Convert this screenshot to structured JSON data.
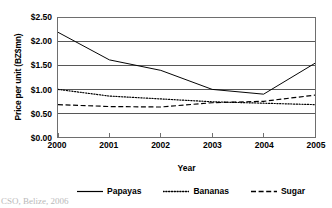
{
  "chart_data": {
    "type": "line",
    "title": "",
    "xlabel": "Year",
    "ylabel": "Price per unit (BZ$mn)",
    "categories": [
      "2000",
      "2001",
      "2002",
      "2003",
      "2004",
      "2005"
    ],
    "x": [
      2000,
      2001,
      2002,
      2003,
      2004,
      2005
    ],
    "xlim": [
      2000,
      2005
    ],
    "ylim": [
      0.0,
      2.5
    ],
    "ytick_values": [
      0.0,
      0.5,
      1.0,
      1.5,
      2.0,
      2.5
    ],
    "ytick_labels": [
      "$0.00",
      "$0.50",
      "$1.00",
      "$1.50",
      "$2.00",
      "$2.50"
    ],
    "xtick_labels": [
      "2000",
      "2001",
      "2002",
      "2003",
      "2004",
      "2005"
    ],
    "grid": "horizontal",
    "legend_position": "below",
    "series": [
      {
        "name": "Papayas",
        "style": "solid",
        "color": "#000000",
        "values": [
          2.2,
          1.62,
          1.4,
          1.0,
          0.9,
          1.55
        ]
      },
      {
        "name": "Bananas",
        "style": "dotted",
        "color": "#000000",
        "values": [
          1.0,
          0.86,
          0.8,
          0.74,
          0.71,
          0.68
        ]
      },
      {
        "name": "Sugar",
        "style": "dashed",
        "color": "#000000",
        "values": [
          0.68,
          0.64,
          0.63,
          0.72,
          0.75,
          0.88
        ]
      }
    ]
  },
  "legend": {
    "items": [
      {
        "label": "Papayas",
        "style": "solid"
      },
      {
        "label": "Bananas",
        "style": "dotted"
      },
      {
        "label": "Sugar",
        "style": "dashed"
      }
    ]
  },
  "caption": {
    "source": "CSO, Belize, 2006"
  },
  "colors": {
    "line": "#000000",
    "grid": "#555555",
    "frame": "#6e6e6e",
    "caption": "#b9b9b9"
  }
}
